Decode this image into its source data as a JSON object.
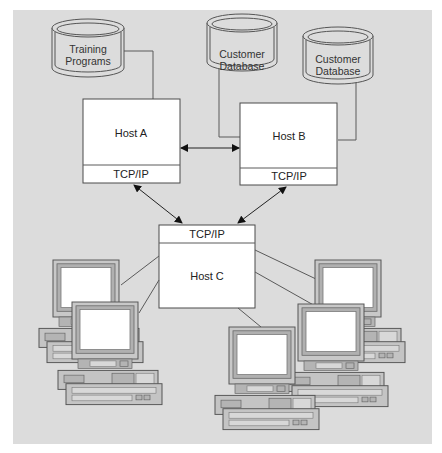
{
  "diagram": {
    "type": "network-topology",
    "databases": [
      {
        "id": "db1",
        "line1": "Training",
        "line2": "Programs",
        "connected_to": "host_a"
      },
      {
        "id": "db2",
        "line1": "Customer",
        "line2": "Database",
        "connected_to": "host_b"
      },
      {
        "id": "db3",
        "line1": "Customer",
        "line2": "Database",
        "connected_to": "host_b"
      }
    ],
    "hosts": [
      {
        "id": "host_a",
        "name": "Host A",
        "protocol": "TCP/IP"
      },
      {
        "id": "host_b",
        "name": "Host B",
        "protocol": "TCP/IP"
      },
      {
        "id": "host_c",
        "name": "Host C",
        "protocol": "TCP/IP"
      }
    ],
    "links": [
      {
        "from": "host_a",
        "to": "host_b",
        "type": "bidirectional-arrow"
      },
      {
        "from": "host_a",
        "to": "host_c",
        "type": "bidirectional-arrow"
      },
      {
        "from": "host_b",
        "to": "host_c",
        "type": "bidirectional-arrow"
      }
    ],
    "workstations": {
      "count": 5,
      "connected_to": "host_c",
      "left_group": 2,
      "right_group": 3
    },
    "colors": {
      "background": "#dcdcdc",
      "box_fill": "#ffffff",
      "stroke": "#4a4a4a"
    }
  }
}
